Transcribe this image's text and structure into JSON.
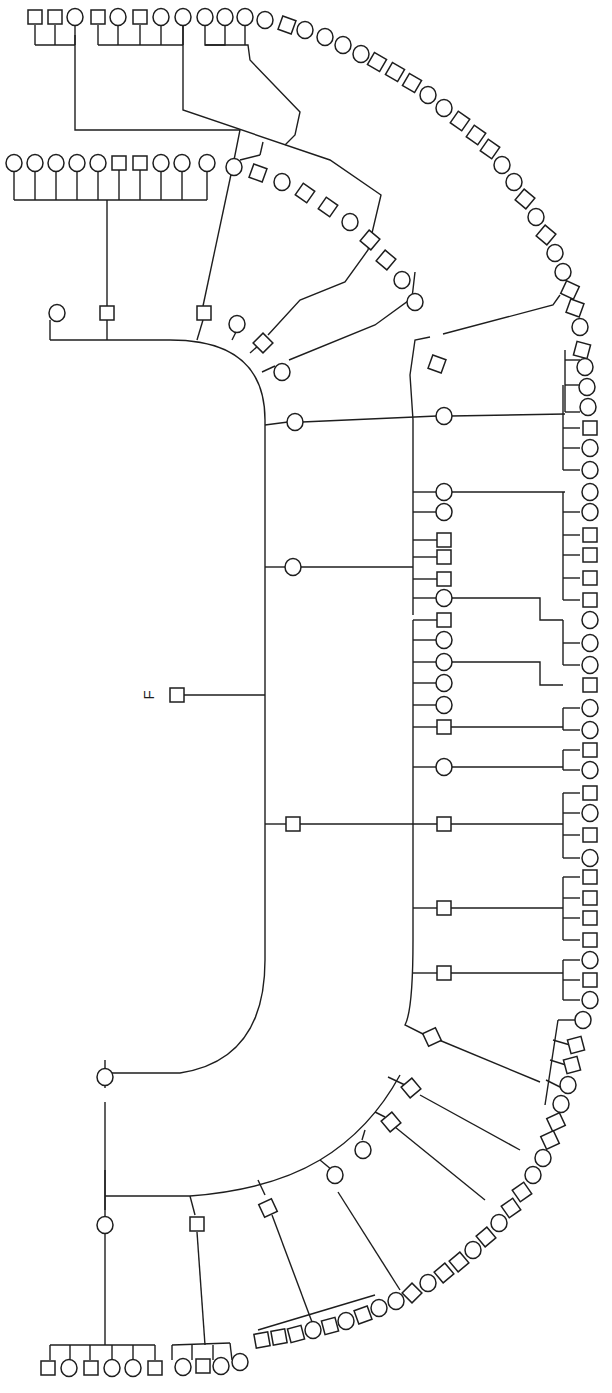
{
  "diagram": {
    "type": "pedigree",
    "proband_label": "F",
    "colors": {
      "line": "#1e1e1e",
      "background": "#ffffff",
      "symbol_fill": "#ffffff"
    },
    "legend": {
      "square": "male",
      "circle": "female"
    },
    "proband": {
      "shape": "square",
      "x": 177,
      "y": 695,
      "label_x": 148,
      "label_y": 695
    }
  },
  "paths": [
    "M184 695 L265 695",
    "M170 340 Q265 340 265 420 L265 960 Q265 1060 180 1073 L105 1073 L105 1060",
    "M50 340 L170 340",
    "M50 340 L50 320",
    "M107 340 L107 320",
    "M107 306 L107 200",
    "M14 200 L207 200",
    "M14 200 L14 170",
    "M35 200 L35 170",
    "M56 200 L56 170",
    "M77 200 L77 170",
    "M98 200 L98 170",
    "M119 200 L119 170",
    "M140 200 L140 170",
    "M161 200 L161 170",
    "M182 200 L182 170",
    "M207 200 L207 170",
    "M197 340 L203 320",
    "M203 306 L233 165",
    "M233 165 L240 130 L75 130 L75 35",
    "M35 45 L75 45",
    "M35 45 L35 25",
    "M55 45 L55 25",
    "M75 45 L75 25",
    "M232 340 L237 330",
    "M250 353 L259 345",
    "M268 335 L300 300 L345 282 L368 250 L381 195 L330 160 L183 110 L183 20",
    "M98 45 L183 45",
    "M98 45 L98 25",
    "M118 45 L118 25",
    "M140 45 L140 25",
    "M161 45 L161 25",
    "M183 45 L183 25",
    "M262 372 L275 366",
    "M289 360 L375 325 L412 298 L415 272",
    "M240 160 L260 155",
    "M260 155 L263 142",
    "M285 145 L295 135 L300 112 L250 60 L248 45 L205 45 L205 25",
    "M205 45 L225 45 L225 25 M245 45 L245 25",
    "M265 425 L288 422",
    "M302 422 L437 416",
    "M451 416 L565 414",
    "M410 375 L415 340 L430 337",
    "M443 334 L553 305 L560 295",
    "M410 375 L413 420 L413 615",
    "M413 492 L437 492",
    "M451 492 L565 492",
    "M413 512 L437 512",
    "M265 567 L286 567",
    "M300 567 L413 567",
    "M413 540 L437 540",
    "M413 557 L437 557",
    "M413 579 L437 579",
    "M413 598 L437 598",
    "M451 598 L540 598 L540 620 L563 620",
    "M413 620 L413 940",
    "M413 620 L437 620",
    "M413 640 L437 640",
    "M413 662 L437 662",
    "M451 662 L540 662 L540 685 L563 685",
    "M413 683 L437 683",
    "M413 705 L437 705",
    "M413 727 L437 727",
    "M451 727 L563 727",
    "M413 767 L437 767",
    "M451 767 L563 767",
    "M265 824 L286 824",
    "M300 824 L437 824",
    "M451 824 L563 824",
    "M413 908 L437 908",
    "M451 908 L563 908",
    "M413 973 L437 973",
    "M451 973 L563 973",
    "M413 940 Q413 1010 405 1025 L425 1035",
    "M439 1040 L540 1082",
    "M565 350 L565 412",
    "M565 360 L580 360",
    "M565 385 L580 385",
    "M565 412 L580 412",
    "M563 385 L563 470",
    "M563 428 L580 428",
    "M563 448 L580 448",
    "M563 470 L580 470",
    "M563 492 L563 600",
    "M563 512 L580 512",
    "M563 535 L580 535",
    "M563 555 L580 555",
    "M563 578 L580 578",
    "M563 600 L580 600",
    "M563 620 L563 665",
    "M563 643 L580 643",
    "M563 665 L580 665",
    "M563 708 L563 730",
    "M563 708 L580 708",
    "M563 730 L580 730",
    "M563 750 L563 770",
    "M563 750 L580 750",
    "M563 770 L580 770",
    "M563 793 L563 858",
    "M563 793 L580 793",
    "M563 813 L580 813",
    "M563 835 L580 835",
    "M563 858 L580 858",
    "M563 877 L563 940",
    "M563 877 L580 877",
    "M563 898 L580 898",
    "M563 918 L580 918",
    "M563 940 L580 940",
    "M563 960 L563 1000",
    "M563 960 L580 960",
    "M563 980 L580 980",
    "M563 1000 L580 1000",
    "M558 1020 L545 1105",
    "M558 1020 L575 1020",
    "M553 1040 L570 1045",
    "M550 1060 L566 1065",
    "M546 1080 L562 1088",
    "M105 1073 L105 1088",
    "M105 1102 L105 1210",
    "M105 1170 L105 1210",
    "M105 1196 L190 1196 Q270 1190 320 1160 Q370 1130 400 1075",
    "M105 1210 L105 1345",
    "M50 1345 L155 1345",
    "M50 1345 L50 1360",
    "M70 1345 L70 1360",
    "M90 1345 L90 1360",
    "M112 1345 L112 1360",
    "M133 1345 L133 1360",
    "M155 1345 L155 1360",
    "M190 1196 L195 1215",
    "M197 1232 L205 1345",
    "M172 1345 L230 1343",
    "M172 1345 L172 1360",
    "M192 1345 L192 1360",
    "M213 1345 L213 1360",
    "M230 1343 L232 1360",
    "M258 1180 L265 1195",
    "M272 1215 L315 1330",
    "M258 1330 L375 1295",
    "M320 1160 L332 1170",
    "M338 1192 L400 1290",
    "M365 1130 L362 1140",
    "M375 1112 L385 1117",
    "M395 1127 L485 1200",
    "M388 1077 L405 1085",
    "M420 1095 L520 1150"
  ],
  "nodes": [
    {
      "s": "c",
      "x": 57,
      "y": 313
    },
    {
      "s": "s",
      "x": 107,
      "y": 313
    },
    {
      "s": "c",
      "x": 14,
      "y": 163
    },
    {
      "s": "c",
      "x": 35,
      "y": 163
    },
    {
      "s": "c",
      "x": 56,
      "y": 163
    },
    {
      "s": "c",
      "x": 77,
      "y": 163
    },
    {
      "s": "c",
      "x": 98,
      "y": 163
    },
    {
      "s": "s",
      "x": 119,
      "y": 163
    },
    {
      "s": "s",
      "x": 140,
      "y": 163
    },
    {
      "s": "c",
      "x": 161,
      "y": 163
    },
    {
      "s": "c",
      "x": 182,
      "y": 163
    },
    {
      "s": "c",
      "x": 207,
      "y": 163
    },
    {
      "s": "s",
      "x": 204,
      "y": 313
    },
    {
      "s": "c",
      "x": 237,
      "y": 324
    },
    {
      "s": "s",
      "x": 263,
      "y": 343,
      "r": 45
    },
    {
      "s": "c",
      "x": 282,
      "y": 372
    },
    {
      "s": "s",
      "x": 35,
      "y": 17
    },
    {
      "s": "s",
      "x": 55,
      "y": 17
    },
    {
      "s": "c",
      "x": 75,
      "y": 17
    },
    {
      "s": "s",
      "x": 98,
      "y": 17
    },
    {
      "s": "c",
      "x": 118,
      "y": 17
    },
    {
      "s": "s",
      "x": 140,
      "y": 17
    },
    {
      "s": "c",
      "x": 161,
      "y": 17
    },
    {
      "s": "c",
      "x": 183,
      "y": 17
    },
    {
      "s": "c",
      "x": 205,
      "y": 17
    },
    {
      "s": "c",
      "x": 225,
      "y": 17
    },
    {
      "s": "c",
      "x": 245,
      "y": 17
    },
    {
      "s": "c",
      "x": 265,
      "y": 20
    },
    {
      "s": "s",
      "x": 287,
      "y": 25,
      "r": 20
    },
    {
      "s": "c",
      "x": 305,
      "y": 30
    },
    {
      "s": "c",
      "x": 325,
      "y": 37
    },
    {
      "s": "c",
      "x": 343,
      "y": 45
    },
    {
      "s": "c",
      "x": 361,
      "y": 54
    },
    {
      "s": "s",
      "x": 377,
      "y": 62,
      "r": 30
    },
    {
      "s": "s",
      "x": 395,
      "y": 72,
      "r": 30
    },
    {
      "s": "s",
      "x": 412,
      "y": 83,
      "r": 30
    },
    {
      "s": "c",
      "x": 428,
      "y": 95
    },
    {
      "s": "c",
      "x": 444,
      "y": 108
    },
    {
      "s": "s",
      "x": 460,
      "y": 121,
      "r": 35
    },
    {
      "s": "s",
      "x": 476,
      "y": 135,
      "r": 35
    },
    {
      "s": "s",
      "x": 490,
      "y": 149,
      "r": 35
    },
    {
      "s": "c",
      "x": 502,
      "y": 165
    },
    {
      "s": "c",
      "x": 514,
      "y": 182
    },
    {
      "s": "s",
      "x": 525,
      "y": 199,
      "r": 40
    },
    {
      "s": "c",
      "x": 536,
      "y": 217
    },
    {
      "s": "s",
      "x": 546,
      "y": 235,
      "r": 40
    },
    {
      "s": "c",
      "x": 555,
      "y": 253
    },
    {
      "s": "c",
      "x": 563,
      "y": 272
    },
    {
      "s": "s",
      "x": 570,
      "y": 290,
      "r": 25
    },
    {
      "s": "s",
      "x": 575,
      "y": 308,
      "r": 20
    },
    {
      "s": "c",
      "x": 580,
      "y": 327
    },
    {
      "s": "c",
      "x": 234,
      "y": 167
    },
    {
      "s": "s",
      "x": 258,
      "y": 173,
      "r": 20
    },
    {
      "s": "c",
      "x": 282,
      "y": 182
    },
    {
      "s": "s",
      "x": 305,
      "y": 193,
      "r": 35
    },
    {
      "s": "s",
      "x": 328,
      "y": 207,
      "r": 35
    },
    {
      "s": "c",
      "x": 350,
      "y": 222
    },
    {
      "s": "s",
      "x": 370,
      "y": 240,
      "r": 40
    },
    {
      "s": "s",
      "x": 386,
      "y": 260,
      "r": 40
    },
    {
      "s": "c",
      "x": 402,
      "y": 280
    },
    {
      "s": "c",
      "x": 415,
      "y": 302
    },
    {
      "s": "s",
      "x": 437,
      "y": 364,
      "r": 20
    },
    {
      "s": "c",
      "x": 295,
      "y": 422
    },
    {
      "s": "c",
      "x": 444,
      "y": 416
    },
    {
      "s": "s",
      "x": 582,
      "y": 350,
      "r": 15
    },
    {
      "s": "c",
      "x": 585,
      "y": 367
    },
    {
      "s": "c",
      "x": 587,
      "y": 387
    },
    {
      "s": "c",
      "x": 588,
      "y": 407
    },
    {
      "s": "s",
      "x": 590,
      "y": 428
    },
    {
      "s": "c",
      "x": 590,
      "y": 448
    },
    {
      "s": "c",
      "x": 590,
      "y": 470
    },
    {
      "s": "c",
      "x": 444,
      "y": 492
    },
    {
      "s": "c",
      "x": 444,
      "y": 512
    },
    {
      "s": "c",
      "x": 590,
      "y": 492
    },
    {
      "s": "c",
      "x": 590,
      "y": 512
    },
    {
      "s": "s",
      "x": 590,
      "y": 535
    },
    {
      "s": "s",
      "x": 590,
      "y": 555
    },
    {
      "s": "s",
      "x": 590,
      "y": 578
    },
    {
      "s": "s",
      "x": 590,
      "y": 600
    },
    {
      "s": "c",
      "x": 293,
      "y": 567
    },
    {
      "s": "s",
      "x": 444,
      "y": 540
    },
    {
      "s": "s",
      "x": 444,
      "y": 557
    },
    {
      "s": "s",
      "x": 444,
      "y": 579
    },
    {
      "s": "c",
      "x": 444,
      "y": 598
    },
    {
      "s": "s",
      "x": 444,
      "y": 620
    },
    {
      "s": "c",
      "x": 444,
      "y": 640
    },
    {
      "s": "c",
      "x": 444,
      "y": 662
    },
    {
      "s": "c",
      "x": 444,
      "y": 683
    },
    {
      "s": "c",
      "x": 444,
      "y": 705
    },
    {
      "s": "s",
      "x": 444,
      "y": 727
    },
    {
      "s": "c",
      "x": 590,
      "y": 620
    },
    {
      "s": "c",
      "x": 590,
      "y": 643
    },
    {
      "s": "c",
      "x": 590,
      "y": 665
    },
    {
      "s": "s",
      "x": 590,
      "y": 685
    },
    {
      "s": "c",
      "x": 590,
      "y": 708
    },
    {
      "s": "c",
      "x": 590,
      "y": 730
    },
    {
      "s": "s",
      "x": 590,
      "y": 750
    },
    {
      "s": "c",
      "x": 590,
      "y": 770
    },
    {
      "s": "c",
      "x": 444,
      "y": 767
    },
    {
      "s": "s",
      "x": 293,
      "y": 824
    },
    {
      "s": "s",
      "x": 444,
      "y": 824
    },
    {
      "s": "s",
      "x": 590,
      "y": 793
    },
    {
      "s": "c",
      "x": 590,
      "y": 813
    },
    {
      "s": "s",
      "x": 590,
      "y": 835
    },
    {
      "s": "c",
      "x": 590,
      "y": 858
    },
    {
      "s": "s",
      "x": 444,
      "y": 908
    },
    {
      "s": "s",
      "x": 590,
      "y": 877
    },
    {
      "s": "s",
      "x": 590,
      "y": 898
    },
    {
      "s": "s",
      "x": 590,
      "y": 918
    },
    {
      "s": "s",
      "x": 590,
      "y": 940
    },
    {
      "s": "s",
      "x": 444,
      "y": 973
    },
    {
      "s": "c",
      "x": 590,
      "y": 960
    },
    {
      "s": "s",
      "x": 590,
      "y": 980
    },
    {
      "s": "c",
      "x": 590,
      "y": 1000
    },
    {
      "s": "s",
      "x": 432,
      "y": 1037,
      "r": -25
    },
    {
      "s": "c",
      "x": 583,
      "y": 1020
    },
    {
      "s": "s",
      "x": 576,
      "y": 1045,
      "r": -15
    },
    {
      "s": "s",
      "x": 572,
      "y": 1065,
      "r": -15
    },
    {
      "s": "c",
      "x": 568,
      "y": 1085
    },
    {
      "s": "c",
      "x": 561,
      "y": 1104
    },
    {
      "s": "s",
      "x": 556,
      "y": 1122,
      "r": -25
    },
    {
      "s": "s",
      "x": 550,
      "y": 1140,
      "r": -25
    },
    {
      "s": "c",
      "x": 543,
      "y": 1158
    },
    {
      "s": "c",
      "x": 533,
      "y": 1175
    },
    {
      "s": "s",
      "x": 522,
      "y": 1192,
      "r": -35
    },
    {
      "s": "s",
      "x": 511,
      "y": 1208,
      "r": -35
    },
    {
      "s": "c",
      "x": 499,
      "y": 1223
    },
    {
      "s": "s",
      "x": 486,
      "y": 1237,
      "r": -40
    },
    {
      "s": "c",
      "x": 473,
      "y": 1250
    },
    {
      "s": "s",
      "x": 459,
      "y": 1262,
      "r": -40
    },
    {
      "s": "s",
      "x": 444,
      "y": 1273,
      "r": -40
    },
    {
      "s": "c",
      "x": 428,
      "y": 1283
    },
    {
      "s": "s",
      "x": 412,
      "y": 1293,
      "r": -45
    },
    {
      "s": "c",
      "x": 396,
      "y": 1301
    },
    {
      "s": "c",
      "x": 379,
      "y": 1308
    },
    {
      "s": "s",
      "x": 363,
      "y": 1315,
      "r": -20
    },
    {
      "s": "c",
      "x": 346,
      "y": 1321
    },
    {
      "s": "s",
      "x": 330,
      "y": 1326,
      "r": -15
    },
    {
      "s": "c",
      "x": 313,
      "y": 1330
    },
    {
      "s": "s",
      "x": 296,
      "y": 1334,
      "r": -15
    },
    {
      "s": "s",
      "x": 279,
      "y": 1337,
      "r": -10
    },
    {
      "s": "s",
      "x": 262,
      "y": 1340,
      "r": -10
    },
    {
      "s": "c",
      "x": 240,
      "y": 1362
    },
    {
      "s": "c",
      "x": 221,
      "y": 1366
    },
    {
      "s": "s",
      "x": 203,
      "y": 1366
    },
    {
      "s": "c",
      "x": 183,
      "y": 1367
    },
    {
      "s": "s",
      "x": 48,
      "y": 1368
    },
    {
      "s": "c",
      "x": 69,
      "y": 1368
    },
    {
      "s": "s",
      "x": 91,
      "y": 1368
    },
    {
      "s": "c",
      "x": 112,
      "y": 1368
    },
    {
      "s": "c",
      "x": 133,
      "y": 1368
    },
    {
      "s": "s",
      "x": 155,
      "y": 1368
    },
    {
      "s": "c",
      "x": 105,
      "y": 1077
    },
    {
      "s": "c",
      "x": 105,
      "y": 1225
    },
    {
      "s": "s",
      "x": 197,
      "y": 1224
    },
    {
      "s": "s",
      "x": 268,
      "y": 1208,
      "r": -25
    },
    {
      "s": "c",
      "x": 335,
      "y": 1175
    },
    {
      "s": "c",
      "x": 363,
      "y": 1150
    },
    {
      "s": "s",
      "x": 391,
      "y": 1122,
      "r": -40
    },
    {
      "s": "s",
      "x": 411,
      "y": 1088,
      "r": -40
    }
  ]
}
